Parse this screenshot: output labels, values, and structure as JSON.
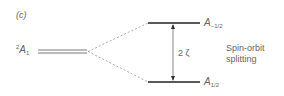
{
  "panel_label": "(c)",
  "ground_state": {
    "sup": "2",
    "symbol": "A",
    "sub": "1"
  },
  "upper_level": {
    "symbol": "A",
    "sub": "−1/2"
  },
  "lower_level": {
    "symbol": "A",
    "sub": "1/2"
  },
  "gap_label": "2 ζ",
  "annotation": [
    "Spin-orbit",
    "splitting"
  ],
  "colors": {
    "line": "#333333",
    "dashed": "#888888",
    "text": "#666666"
  }
}
